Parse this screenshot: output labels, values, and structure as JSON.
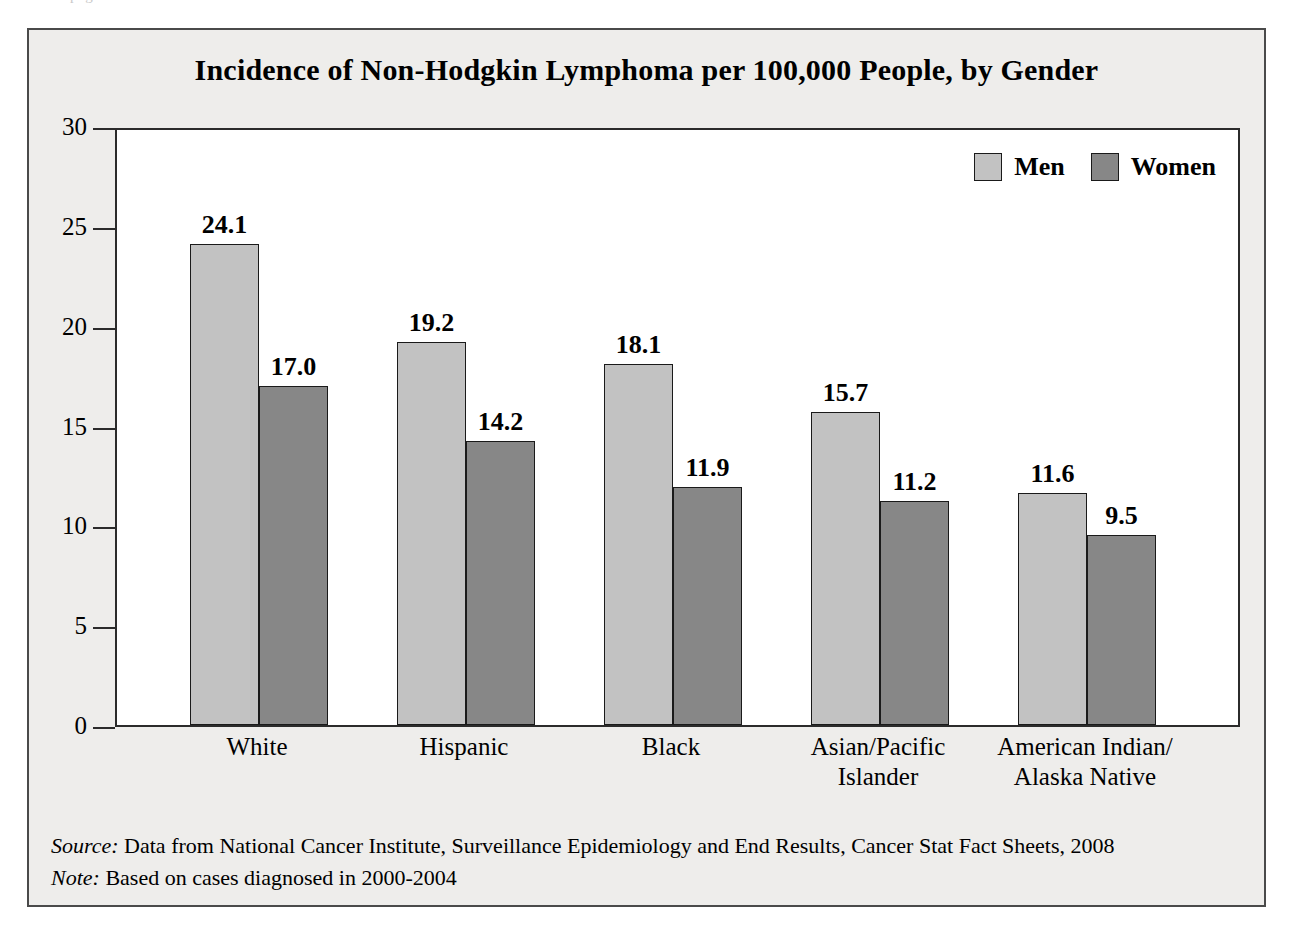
{
  "artifact": {
    "top_sliver_text": "page-header remnant"
  },
  "chart_data": {
    "type": "bar",
    "title": "Incidence of Non-Hodgkin Lymphoma per 100,000 People, by Gender",
    "xlabel": "",
    "ylabel": "",
    "ylim": [
      0,
      30
    ],
    "yticks": [
      0,
      5,
      10,
      15,
      20,
      25,
      30
    ],
    "ytick_labels": [
      "0",
      "5",
      "10",
      "15",
      "20",
      "25",
      "30"
    ],
    "grid": false,
    "legend_position": "top-right",
    "categories": [
      "White",
      "Hispanic",
      "Black",
      "Asian/Pacific Islander",
      "American Indian/Alaska Native"
    ],
    "category_label_lines": [
      [
        "White"
      ],
      [
        "Hispanic"
      ],
      [
        "Black"
      ],
      [
        "Asian/Pacific",
        "Islander"
      ],
      [
        "American Indian/",
        "Alaska Native"
      ]
    ],
    "series": [
      {
        "name": "Men",
        "color": "#c2c2c2",
        "values": [
          24.1,
          19.2,
          18.1,
          15.7,
          11.6
        ],
        "value_labels": [
          "24.1",
          "19.2",
          "18.1",
          "15.7",
          "11.6"
        ]
      },
      {
        "name": "Women",
        "color": "#878787",
        "values": [
          17.0,
          14.2,
          11.9,
          11.2,
          9.5
        ],
        "value_labels": [
          "17.0",
          "14.2",
          "11.9",
          "11.2",
          "9.5"
        ]
      }
    ]
  },
  "legend": {
    "items": [
      {
        "label": "Men",
        "color": "#c2c2c2"
      },
      {
        "label": "Women",
        "color": "#878787"
      }
    ]
  },
  "footnotes": [
    {
      "lead": "Source:",
      "text": "Data from National Cancer Institute, Surveillance Epidemiology and End Results, Cancer Stat Fact Sheets, 2008"
    },
    {
      "lead": "Note:",
      "text": "Based on cases diagnosed in 2000-2004"
    }
  ],
  "colors": {
    "panel_background": "#eeedeb",
    "panel_border": "#4a4a4a",
    "plot_background": "#ffffff",
    "plot_border": "#2b2b2b",
    "men_bar": "#c2c2c2",
    "women_bar": "#878787",
    "text": "#000000"
  }
}
